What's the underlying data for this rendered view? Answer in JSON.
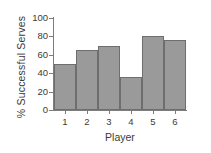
{
  "chart_data": {
    "type": "bar",
    "title": "",
    "xlabel": "Player",
    "ylabel": "% Successful Serves",
    "categories": [
      "1",
      "2",
      "3",
      "4",
      "5",
      "6"
    ],
    "values": [
      50,
      65,
      70,
      36,
      80,
      76
    ],
    "ylim": [
      0,
      100
    ],
    "yticks": [
      0,
      20,
      40,
      60,
      80,
      100
    ],
    "ytick_labels": [
      "0",
      "20",
      "40",
      "60",
      "80",
      "100"
    ],
    "grid": false,
    "legend": null,
    "bar_color": "#9a9a9a",
    "bar_edge_color": "#6e6e6e",
    "axis_color": "#7d7d7d",
    "text_color": "#3a3a3a",
    "background_color": "#ffffff",
    "bars_contiguous": true
  }
}
